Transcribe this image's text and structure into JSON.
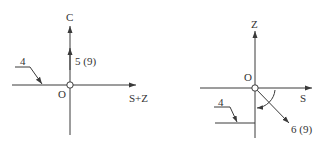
{
  "colors": {
    "line": "#3a3a3a",
    "text": "#333333",
    "background": "#ffffff"
  },
  "left_diagram": {
    "vertical_axis_label": "C",
    "horizontal_axis_label": "S+Z",
    "origin_label": "O",
    "vector_label": "5 (9)",
    "leader_label": "4"
  },
  "right_diagram": {
    "vertical_axis_label": "Z",
    "horizontal_axis_label": "S",
    "origin_label": "O",
    "vector_label": "6 (9)",
    "leader_label": "4"
  }
}
